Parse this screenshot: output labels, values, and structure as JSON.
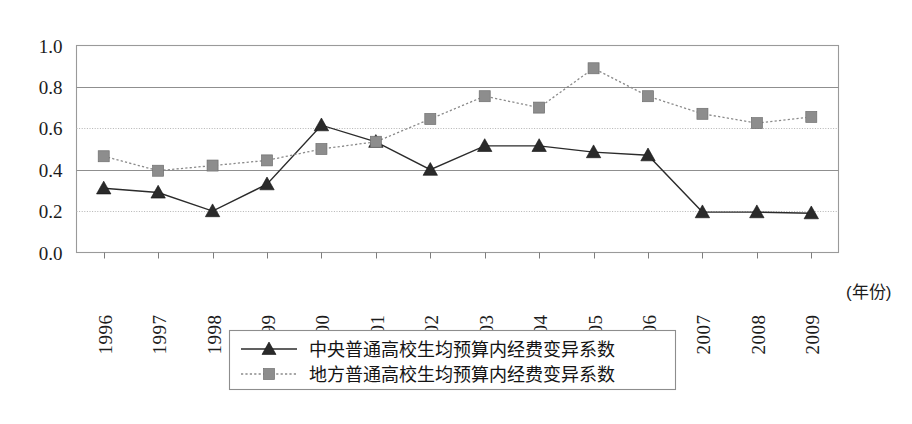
{
  "chart_data": {
    "type": "line",
    "title": "",
    "xlabel": "(年份)",
    "ylabel": "",
    "grid": true,
    "legend_position": "bottom-center",
    "xlim": [
      1995.5,
      2009.5
    ],
    "ylim": [
      0.0,
      1.0
    ],
    "ytick_labels": [
      "1.0",
      "0.8",
      "0.6",
      "0.4",
      "0.2",
      "0.0"
    ],
    "ytick_values": [
      1.0,
      0.8,
      0.6,
      0.4,
      0.2,
      0.0
    ],
    "categories": [
      "1996",
      "1997",
      "1998",
      "1999",
      "2000",
      "2001",
      "2002",
      "2003",
      "2004",
      "2005",
      "2006",
      "2007",
      "2008",
      "2009"
    ],
    "series": [
      {
        "name": "中央普通高校生均预算内经费变异系数",
        "marker": "triangle",
        "line_style": "solid",
        "color": "#2a2a2a",
        "values": [
          0.31,
          0.29,
          0.2,
          0.33,
          0.615,
          0.535,
          0.4,
          0.515,
          0.515,
          0.485,
          0.47,
          0.195,
          0.195,
          0.19
        ]
      },
      {
        "name": "地方普通高校生均预算内经费变异系数",
        "marker": "square",
        "line_style": "dotted",
        "color": "#8d8d8d",
        "values": [
          0.465,
          0.395,
          0.42,
          0.445,
          0.5,
          0.535,
          0.645,
          0.755,
          0.7,
          0.89,
          0.755,
          0.67,
          0.625,
          0.655
        ]
      }
    ]
  },
  "legend": {
    "entries": [
      {
        "label": "中央普通高校生均预算内经费变异系数"
      },
      {
        "label": "地方普通高校生均预算内经费变异系数"
      }
    ]
  },
  "axis": {
    "x_unit_label": "(年份)"
  }
}
